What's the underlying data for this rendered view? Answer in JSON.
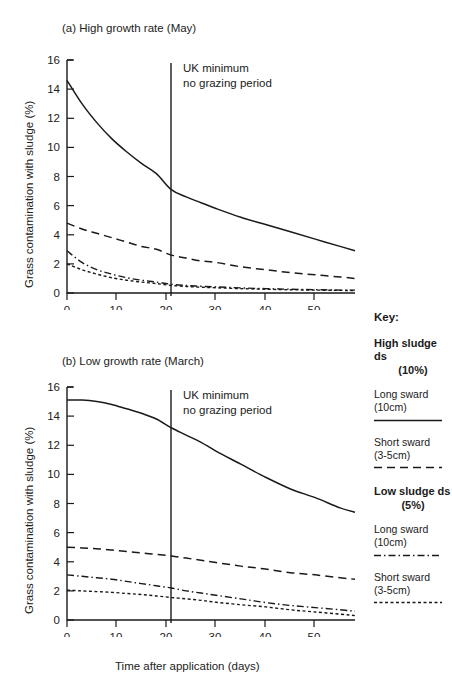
{
  "figure": {
    "xlabel": "Time after application (days)",
    "ylabel": "Grass contamination with sludge (%)",
    "panel_a_title": "(a) High growth rate (May)",
    "panel_b_title": "(b) Low growth rate (March)",
    "annotation_line1": "UK minimum",
    "annotation_line2": "no grazing period"
  },
  "key": {
    "title": "Key:",
    "groups": [
      {
        "heading": "High sludge ds",
        "percent": "(10%)",
        "items": [
          {
            "line1": "Long sward",
            "line2": "(10cm)",
            "style": "solid"
          },
          {
            "line1": "Short sward",
            "line2": "(3-5cm)",
            "style": "dashed"
          }
        ]
      },
      {
        "heading": "Low sludge ds",
        "percent": "(5%)",
        "items": [
          {
            "line1": "Long sward",
            "line2": "(10cm)",
            "style": "dash-dot"
          },
          {
            "line1": "Short sward",
            "line2": "(3-5cm)",
            "style": "dotted"
          }
        ]
      }
    ]
  },
  "chart_data": [
    {
      "type": "line",
      "title": "(a) High growth rate (May)",
      "xlabel": "Time after application (days)",
      "ylabel": "Grass contamination with sludge (%)",
      "xlim": [
        0,
        58
      ],
      "ylim": [
        0,
        16
      ],
      "xticks": [
        0,
        10,
        20,
        30,
        40,
        50
      ],
      "yticks": [
        0,
        2,
        4,
        6,
        8,
        10,
        12,
        14,
        16
      ],
      "grid": false,
      "legend_position": "external-right",
      "annotations": [
        {
          "text": "UK minimum no grazing period",
          "x": 21,
          "type": "vertical-line"
        }
      ],
      "x": [
        0,
        3,
        6,
        9,
        12,
        15,
        18,
        21,
        24,
        27,
        30,
        35,
        40,
        45,
        50,
        55,
        58
      ],
      "series": [
        {
          "name": "High sludge ds (10%) - Long sward (10cm)",
          "style": "solid",
          "values": [
            14.6,
            13.0,
            11.7,
            10.6,
            9.7,
            8.9,
            8.2,
            7.1,
            6.6,
            6.2,
            5.8,
            5.2,
            4.7,
            4.2,
            3.7,
            3.2,
            2.9
          ]
        },
        {
          "name": "High sludge ds (10%) - Short sward (3-5cm)",
          "style": "dashed",
          "values": [
            4.8,
            4.4,
            4.1,
            3.8,
            3.5,
            3.2,
            3.0,
            2.6,
            2.4,
            2.2,
            2.1,
            1.8,
            1.6,
            1.4,
            1.25,
            1.1,
            1.0
          ]
        },
        {
          "name": "Low sludge ds (5%) - Long sward (10cm)",
          "style": "dash-dot",
          "values": [
            2.9,
            2.1,
            1.6,
            1.3,
            1.05,
            0.88,
            0.75,
            0.6,
            0.52,
            0.46,
            0.42,
            0.35,
            0.3,
            0.26,
            0.23,
            0.2,
            0.2
          ]
        },
        {
          "name": "Low sludge ds (5%) - Short sward (3-5cm)",
          "style": "dotted",
          "values": [
            2.0,
            1.6,
            1.3,
            1.05,
            0.88,
            0.75,
            0.65,
            0.52,
            0.45,
            0.4,
            0.36,
            0.3,
            0.26,
            0.22,
            0.2,
            0.18,
            0.16
          ]
        }
      ]
    },
    {
      "type": "line",
      "title": "(b) Low growth rate (March)",
      "xlabel": "Time after application (days)",
      "ylabel": "Grass contamination with sludge (%)",
      "xlim": [
        0,
        58
      ],
      "ylim": [
        0,
        16
      ],
      "xticks": [
        0,
        10,
        20,
        30,
        40,
        50
      ],
      "yticks": [
        0,
        2,
        4,
        6,
        8,
        10,
        12,
        14,
        16
      ],
      "grid": false,
      "legend_position": "external-right",
      "annotations": [
        {
          "text": "UK minimum no grazing period",
          "x": 21,
          "type": "vertical-line"
        }
      ],
      "x": [
        0,
        3,
        6,
        9,
        12,
        15,
        18,
        21,
        24,
        27,
        30,
        35,
        40,
        45,
        50,
        55,
        58
      ],
      "series": [
        {
          "name": "High sludge ds (10%) - Long sward (10cm)",
          "style": "solid",
          "values": [
            15.1,
            15.1,
            15.0,
            14.8,
            14.5,
            14.2,
            13.8,
            13.2,
            12.7,
            12.2,
            11.6,
            10.7,
            9.8,
            9.0,
            8.4,
            7.7,
            7.4
          ]
        },
        {
          "name": "High sludge ds (10%) - Short sward (3-5cm)",
          "style": "dashed",
          "values": [
            5.0,
            4.95,
            4.9,
            4.8,
            4.7,
            4.6,
            4.5,
            4.4,
            4.25,
            4.1,
            3.95,
            3.7,
            3.5,
            3.25,
            3.1,
            2.9,
            2.8
          ]
        },
        {
          "name": "Low sludge ds (5%) - Long sward (10cm)",
          "style": "dash-dot",
          "values": [
            3.1,
            3.0,
            2.9,
            2.8,
            2.65,
            2.5,
            2.35,
            2.2,
            2.0,
            1.85,
            1.7,
            1.45,
            1.2,
            1.0,
            0.85,
            0.7,
            0.6
          ]
        },
        {
          "name": "Low sludge ds (5%) - Short sward (3-5cm)",
          "style": "dotted",
          "values": [
            2.05,
            2.0,
            1.95,
            1.9,
            1.82,
            1.75,
            1.65,
            1.55,
            1.45,
            1.35,
            1.22,
            1.05,
            0.9,
            0.7,
            0.55,
            0.4,
            0.3
          ]
        }
      ]
    }
  ]
}
